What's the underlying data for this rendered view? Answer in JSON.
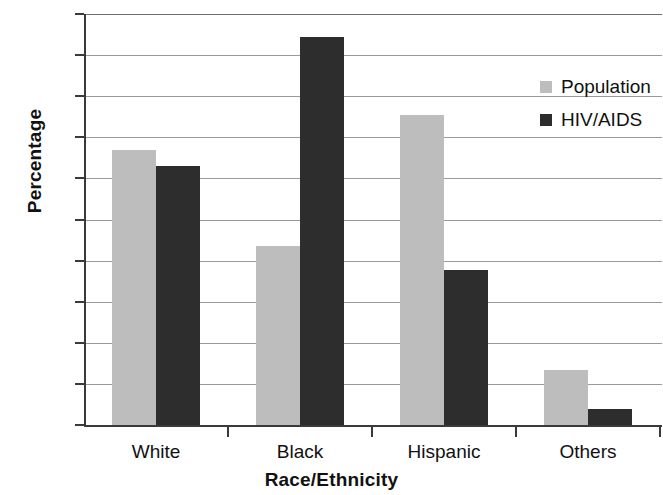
{
  "chart_data": {
    "type": "bar",
    "title": "",
    "xlabel": "Race/Ethnicity",
    "ylabel": "Percentage",
    "categories": [
      "White",
      "Black",
      "Hispanic",
      "Others"
    ],
    "series": [
      {
        "name": "Population",
        "color": "#bdbdbd",
        "values": [
          33.4,
          21.8,
          37.7,
          6.7
        ]
      },
      {
        "name": "HIV/AIDS",
        "color": "#2d2d2d",
        "values": [
          31.5,
          47.2,
          18.8,
          1.9
        ]
      }
    ],
    "ylim": [
      0,
      50
    ],
    "ytick_step": 5,
    "yticks": [
      50,
      45,
      40,
      35,
      30,
      25,
      20,
      15,
      10,
      5,
      0
    ],
    "grid": true,
    "legend_position": "top-right"
  }
}
